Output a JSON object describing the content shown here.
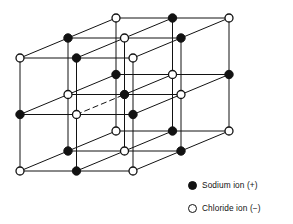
{
  "figure": {
    "name": "sodium-chloride-crystal-lattice"
  },
  "legend": {
    "items": [
      {
        "marker": "filled-circle-icon",
        "label": "Sodium ion (+)"
      },
      {
        "marker": "open-circle-icon",
        "label": "Chloride ion (−)"
      }
    ]
  },
  "colors": {
    "ink": "#121212",
    "background": "#ffffff",
    "sodium_fill": "#121212",
    "chloride_fill": "#ffffff"
  },
  "lattice": {
    "type": "rock-salt-cubic",
    "counts": {
      "nx": 3,
      "ny": 3,
      "nz": 3,
      "total_ions": 27
    },
    "projection": {
      "origin_x": 20,
      "origin_y": 171,
      "step_x": 56.5,
      "step_y": -56.5,
      "depth_dx": 48,
      "depth_dy": -20
    },
    "parity_rule": "sum of indices even = chloride (open circle); odd = sodium (filled circle)",
    "marker_radius": {
      "sodium": 4.2,
      "chloride": 4.0
    },
    "line_width": 1.0
  }
}
